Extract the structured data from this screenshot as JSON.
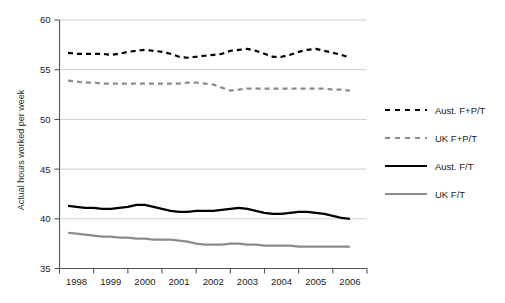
{
  "chart_data": {
    "type": "line",
    "title": "",
    "subtitle": "",
    "xlabel": "",
    "ylabel": "Actual hours worked per week",
    "xlim": [
      1997.75,
      2006.75
    ],
    "ylim": [
      35,
      60
    ],
    "yticks": [
      35,
      40,
      45,
      50,
      55,
      60
    ],
    "ytick_labels": [
      "35",
      "40",
      "45",
      "50",
      "55",
      "60"
    ],
    "grid": true,
    "grid_axis": "y",
    "legend_position": "right",
    "x_categories": [
      "1998",
      "1999",
      "2000",
      "2001",
      "2002",
      "2003",
      "2004",
      "2005",
      "2006"
    ],
    "x": [
      1998.0,
      1998.25,
      1998.5,
      1998.75,
      1999.0,
      1999.25,
      1999.5,
      1999.75,
      2000.0,
      2000.25,
      2000.5,
      2000.75,
      2001.0,
      2001.25,
      2001.5,
      2001.75,
      2002.0,
      2002.25,
      2002.5,
      2002.75,
      2003.0,
      2003.25,
      2003.5,
      2003.75,
      2004.0,
      2004.25,
      2004.5,
      2004.75,
      2005.0,
      2005.25,
      2005.5,
      2005.75,
      2006.0,
      2006.25
    ],
    "series": [
      {
        "name": "Aust. F+P/T",
        "color": "#000000",
        "style": "dashed",
        "width": 2.2,
        "values": [
          56.7,
          56.6,
          56.6,
          56.6,
          56.6,
          56.5,
          56.6,
          56.8,
          56.9,
          57.0,
          56.9,
          56.8,
          56.6,
          56.3,
          56.2,
          56.3,
          56.4,
          56.5,
          56.6,
          56.9,
          57.0,
          57.1,
          56.9,
          56.6,
          56.3,
          56.3,
          56.5,
          56.8,
          57.0,
          57.1,
          56.9,
          56.7,
          56.5,
          56.2
        ]
      },
      {
        "name": "UK F+P/T",
        "color": "#8c8c8c",
        "style": "dashed",
        "width": 2.2,
        "values": [
          53.9,
          53.8,
          53.7,
          53.7,
          53.6,
          53.6,
          53.6,
          53.6,
          53.6,
          53.6,
          53.6,
          53.6,
          53.6,
          53.6,
          53.7,
          53.7,
          53.6,
          53.5,
          53.2,
          52.9,
          53.0,
          53.1,
          53.1,
          53.1,
          53.1,
          53.1,
          53.1,
          53.1,
          53.1,
          53.1,
          53.1,
          53.0,
          53.0,
          52.9
        ]
      },
      {
        "name": "Aust. F/T",
        "color": "#000000",
        "style": "solid",
        "width": 2.2,
        "values": [
          41.3,
          41.2,
          41.1,
          41.1,
          41.0,
          41.0,
          41.1,
          41.2,
          41.4,
          41.4,
          41.2,
          41.0,
          40.8,
          40.7,
          40.7,
          40.8,
          40.8,
          40.8,
          40.9,
          41.0,
          41.1,
          41.0,
          40.8,
          40.6,
          40.5,
          40.5,
          40.6,
          40.7,
          40.7,
          40.6,
          40.5,
          40.3,
          40.1,
          40.0
        ]
      },
      {
        "name": "UK F/T",
        "color": "#8c8c8c",
        "style": "solid",
        "width": 2.2,
        "values": [
          38.6,
          38.5,
          38.4,
          38.3,
          38.2,
          38.2,
          38.1,
          38.1,
          38.0,
          38.0,
          37.9,
          37.9,
          37.9,
          37.8,
          37.7,
          37.5,
          37.4,
          37.4,
          37.4,
          37.5,
          37.5,
          37.4,
          37.4,
          37.3,
          37.3,
          37.3,
          37.3,
          37.2,
          37.2,
          37.2,
          37.2,
          37.2,
          37.2,
          37.2
        ]
      }
    ]
  },
  "legend": {
    "items": [
      {
        "label": "Aust. F+P/T",
        "style": "dashed",
        "color": "#000000"
      },
      {
        "label": "UK F+P/T",
        "style": "dashed",
        "color": "#8c8c8c"
      },
      {
        "label": "Aust. F/T",
        "style": "solid",
        "color": "#000000"
      },
      {
        "label": "UK F/T",
        "style": "solid",
        "color": "#8c8c8c"
      }
    ]
  },
  "axes": {
    "y_title": "Actual hours worked per week",
    "y_ticks": [
      "60",
      "55",
      "50",
      "45",
      "40",
      "35"
    ],
    "x_ticks": [
      "1998",
      "1999",
      "2000",
      "2001",
      "2002",
      "2003",
      "2004",
      "2005",
      "2006"
    ]
  },
  "colors": {
    "aust": "#000000",
    "uk": "#8c8c8c",
    "grid": "#cfcfcf",
    "axis": "#555555",
    "text": "#222222",
    "background": "#ffffff"
  }
}
